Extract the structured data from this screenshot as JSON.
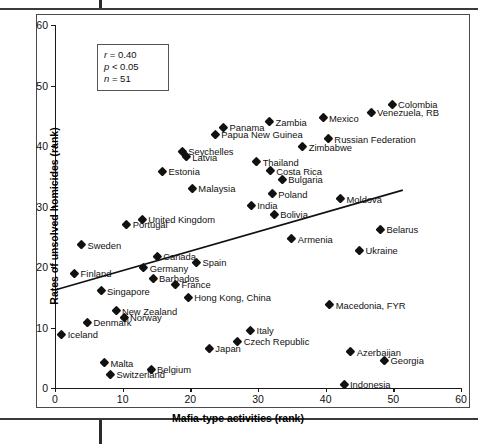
{
  "figure": {
    "axes": {
      "xlabel": "Mafia-type activities (rank)",
      "ylabel": "Rates of unsolved homicides (rank)",
      "x_ticks": [
        "0",
        "10",
        "20",
        "30",
        "40",
        "50",
        "60"
      ],
      "y_ticks": [
        "0",
        "10",
        "20",
        "30",
        "40",
        "50",
        "60"
      ]
    },
    "stats": {
      "r_line": "r = 0.40",
      "p_line": "p < 0.05",
      "n_line": "n = 51"
    }
  },
  "chart_data": {
    "type": "scatter",
    "title": "",
    "xlabel": "Mafia-type activities (rank)",
    "ylabel": "Rates of unsolved homicides (rank)",
    "xlim": [
      0,
      60
    ],
    "ylim": [
      0,
      60
    ],
    "xticks": [
      0,
      10,
      20,
      30,
      40,
      50,
      60
    ],
    "yticks": [
      0,
      10,
      20,
      30,
      40,
      50,
      60
    ],
    "grid": false,
    "legend": null,
    "annotations": [
      "r = 0.40",
      "p < 0.05",
      "n = 51"
    ],
    "correlation_r": 0.4,
    "p_value_text": "p < 0.05",
    "n": 51,
    "trendline": {
      "x0": 0.0,
      "y0": 16.2,
      "x1": 51.4,
      "y1": 32.7
    },
    "points": [
      {
        "label": "Iceland",
        "x": 1.0,
        "y": 8.9,
        "side": "r"
      },
      {
        "label": "Finland",
        "x": 2.9,
        "y": 19.0,
        "side": "r"
      },
      {
        "label": "Sweden",
        "x": 3.9,
        "y": 23.7,
        "side": "r"
      },
      {
        "label": "Denmark",
        "x": 4.8,
        "y": 10.9,
        "side": "r"
      },
      {
        "label": "Singapore",
        "x": 6.8,
        "y": 16.1,
        "side": "r"
      },
      {
        "label": "Malta",
        "x": 7.3,
        "y": 4.2,
        "side": "r"
      },
      {
        "label": "Switzerland",
        "x": 8.2,
        "y": 2.3,
        "side": "r"
      },
      {
        "label": "New Zealand",
        "x": 9.0,
        "y": 12.8,
        "side": "r"
      },
      {
        "label": "Norway",
        "x": 10.2,
        "y": 11.7,
        "side": "r"
      },
      {
        "label": "Portugal",
        "x": 10.6,
        "y": 27.1,
        "side": "r"
      },
      {
        "label": "United Kingdom",
        "x": 12.9,
        "y": 27.9,
        "side": "r"
      },
      {
        "label": "Germany",
        "x": 13.1,
        "y": 19.9,
        "side": "r"
      },
      {
        "label": "Belgium",
        "x": 14.2,
        "y": 3.1,
        "side": "r"
      },
      {
        "label": "Barbados",
        "x": 14.5,
        "y": 18.1,
        "side": "r"
      },
      {
        "label": "Canada",
        "x": 15.1,
        "y": 21.8,
        "side": "r"
      },
      {
        "label": "Estonia",
        "x": 15.9,
        "y": 35.8,
        "side": "r"
      },
      {
        "label": "France",
        "x": 17.8,
        "y": 17.2,
        "side": "r"
      },
      {
        "label": "Seychelles",
        "x": 18.8,
        "y": 39.1,
        "side": "r"
      },
      {
        "label": "Latvia",
        "x": 19.4,
        "y": 38.2,
        "side": "r"
      },
      {
        "label": "Hong Kong, China",
        "x": 19.7,
        "y": 15.0,
        "side": "r"
      },
      {
        "label": "Malaysia",
        "x": 20.3,
        "y": 33.0,
        "side": "r"
      },
      {
        "label": "Spain",
        "x": 20.9,
        "y": 20.8,
        "side": "r"
      },
      {
        "label": "Japan",
        "x": 22.8,
        "y": 6.6,
        "side": "r"
      },
      {
        "label": "Papua New Guinea",
        "x": 23.7,
        "y": 42.0,
        "side": "r"
      },
      {
        "label": "Panama",
        "x": 24.9,
        "y": 43.1,
        "side": "r"
      },
      {
        "label": "Czech Republic",
        "x": 27.0,
        "y": 7.7,
        "side": "r"
      },
      {
        "label": "Italy",
        "x": 28.9,
        "y": 9.6,
        "side": "r"
      },
      {
        "label": "India",
        "x": 29.0,
        "y": 30.2,
        "side": "r"
      },
      {
        "label": "Thailand",
        "x": 29.8,
        "y": 37.4,
        "side": "r"
      },
      {
        "label": "Zambia",
        "x": 31.7,
        "y": 44.0,
        "side": "r"
      },
      {
        "label": "Costa Rica",
        "x": 31.8,
        "y": 35.9,
        "side": "r"
      },
      {
        "label": "Poland",
        "x": 32.1,
        "y": 32.1,
        "side": "r"
      },
      {
        "label": "Bolivia",
        "x": 32.4,
        "y": 28.7,
        "side": "r"
      },
      {
        "label": "Bulgaria",
        "x": 33.6,
        "y": 34.5,
        "side": "r"
      },
      {
        "label": "Armenia",
        "x": 35.0,
        "y": 24.7,
        "side": "r"
      },
      {
        "label": "Zimbabwe",
        "x": 36.6,
        "y": 39.9,
        "side": "r"
      },
      {
        "label": "Mexico",
        "x": 39.6,
        "y": 44.7,
        "side": "r"
      },
      {
        "label": "Russian Federation",
        "x": 40.4,
        "y": 41.2,
        "side": "r"
      },
      {
        "label": "Macedonia, FYR",
        "x": 40.6,
        "y": 13.8,
        "side": "r"
      },
      {
        "label": "Moldova",
        "x": 42.2,
        "y": 31.3,
        "side": "r"
      },
      {
        "label": "Indonesia",
        "x": 42.7,
        "y": 0.6,
        "side": "r"
      },
      {
        "label": "Azerbaijan",
        "x": 43.7,
        "y": 6.0,
        "side": "r"
      },
      {
        "label": "Ukraine",
        "x": 45.0,
        "y": 22.8,
        "side": "r"
      },
      {
        "label": "Venezuela, RB",
        "x": 46.7,
        "y": 45.6,
        "side": "r"
      },
      {
        "label": "Belarus",
        "x": 48.1,
        "y": 26.2,
        "side": "r"
      },
      {
        "label": "Georgia",
        "x": 48.7,
        "y": 4.6,
        "side": "r"
      },
      {
        "label": "Colombia",
        "x": 49.8,
        "y": 46.9,
        "side": "r"
      }
    ]
  }
}
